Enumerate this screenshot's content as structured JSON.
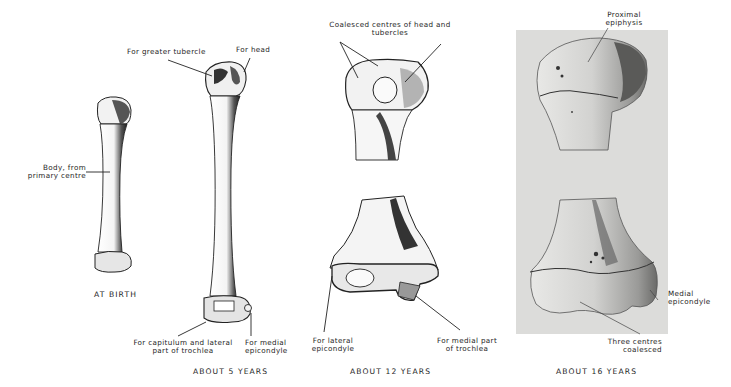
{
  "figure": {
    "stages": [
      {
        "id": "at-birth",
        "caption": "AT BIRTH",
        "labels": [
          {
            "id": "body",
            "line1": "Body, from",
            "line2": "primary centre"
          }
        ]
      },
      {
        "id": "about-5-years",
        "caption": "ABOUT 5 YEARS",
        "labels": [
          {
            "id": "greater-tubercle",
            "line1": "For greater tubercle"
          },
          {
            "id": "head",
            "line1": "For head"
          },
          {
            "id": "capitulum",
            "line1": "For capitulum and lateral",
            "line2": "part of trochlea"
          },
          {
            "id": "medial-epicondyle",
            "line1": "For medial",
            "line2": "epicondyle"
          }
        ]
      },
      {
        "id": "about-12-years",
        "caption": "ABOUT 12 YEARS",
        "labels": [
          {
            "id": "coalesced-head",
            "line1": "Coalesced centres of head and",
            "line2": "tubercles"
          },
          {
            "id": "lateral-epicondyle",
            "line1": "For lateral",
            "line2": "epicondyle"
          },
          {
            "id": "medial-trochlea",
            "line1": "For medial part",
            "line2": "of trochlea"
          }
        ]
      },
      {
        "id": "about-16-years",
        "caption": "ABOUT 16 YEARS",
        "labels": [
          {
            "id": "proximal-epiphysis",
            "line1": "Proximal",
            "line2": "epiphysis"
          },
          {
            "id": "medial-epicondyle-16",
            "line1": "Medial",
            "line2": "epicondyle"
          },
          {
            "id": "three-centres",
            "line1": "Three centres",
            "line2": "coalesced"
          }
        ]
      }
    ]
  },
  "colors": {
    "background": "#ffffff",
    "ink": "#1e1e1e",
    "photo_background": "#dcdcda"
  }
}
